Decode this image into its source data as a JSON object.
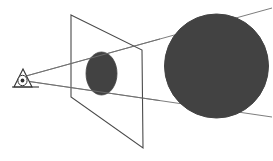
{
  "figure": {
    "name": "perspective-projection-diagram",
    "background_color": "#ffffff",
    "canvas": {
      "width": 273,
      "height": 161
    }
  },
  "colors": {
    "object_fill": "#424242",
    "object_stroke": "#424242",
    "plane_stroke": "#4a4a4a",
    "ray_stroke": "#6e6e6e",
    "eye_stroke": "#333333",
    "eye_fill": "#ffffff",
    "background": "#ffffff"
  },
  "strokes": {
    "plane_width": 1.1,
    "ray_width": 0.9,
    "eye_width": 1.1
  },
  "viewpoint": {
    "label": "eye",
    "center_x": 22,
    "center_y": 79,
    "triangle": "14,87 23,69 32,87",
    "base_line": "12,87 39,87",
    "pupil": {
      "cx": 22.5,
      "cy": 80.5,
      "rx": 4.6,
      "ry": 5.2
    },
    "iris": {
      "cx": 22.5,
      "cy": 80.5,
      "r": 1.9
    }
  },
  "image_plane": {
    "label": "image plane",
    "points": "71,15 142,50 143,148 71,97",
    "corners": [
      {
        "name": "top-left",
        "x": 71,
        "y": 15
      },
      {
        "name": "top-right",
        "x": 142,
        "y": 50
      },
      {
        "name": "bottom-right",
        "x": 143,
        "y": 148
      },
      {
        "name": "bottom-left",
        "x": 71,
        "y": 97
      }
    ]
  },
  "projected_image": {
    "label": "projected ellipse on image plane",
    "cx": 101.5,
    "cy": 73.5,
    "rx": 15.5,
    "ry": 21.5
  },
  "object": {
    "label": "sphere",
    "cx": 216.5,
    "cy": 66,
    "r": 52
  },
  "rays": [
    {
      "name": "upper-projection-ray",
      "x1": 26,
      "y1": 76,
      "x2": 272,
      "y2": 8
    },
    {
      "name": "lower-projection-ray",
      "x1": 26,
      "y1": 81,
      "x2": 272,
      "y2": 117
    }
  ]
}
